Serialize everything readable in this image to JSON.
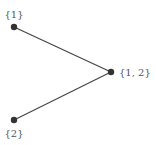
{
  "diagram": {
    "type": "hasse-diagram",
    "colors": {
      "edge": "#444444",
      "node": "#333333",
      "label": "#555555",
      "background": "#ffffff"
    },
    "nodes": [
      {
        "id": "n1",
        "label": "{1}",
        "x": 14,
        "y": 27
      },
      {
        "id": "n12",
        "label": "{1, 2}",
        "x": 111,
        "y": 72
      },
      {
        "id": "n2",
        "label": "{2}",
        "x": 14,
        "y": 120
      }
    ],
    "edges": [
      {
        "from": "n1",
        "to": "n12"
      },
      {
        "from": "n2",
        "to": "n12"
      }
    ]
  }
}
